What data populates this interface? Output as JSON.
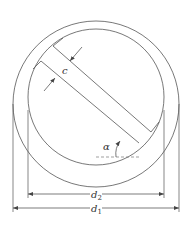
{
  "diagram": {
    "type": "technical-drawing",
    "labels": {
      "width": "c",
      "angle": "α",
      "inner_diameter": "d",
      "inner_diameter_sub": "2",
      "outer_diameter": "d",
      "outer_diameter_sub": "1"
    },
    "colors": {
      "line": "#555555",
      "dashed": "#777777",
      "text": "#333333",
      "background": "#ffffff"
    }
  }
}
